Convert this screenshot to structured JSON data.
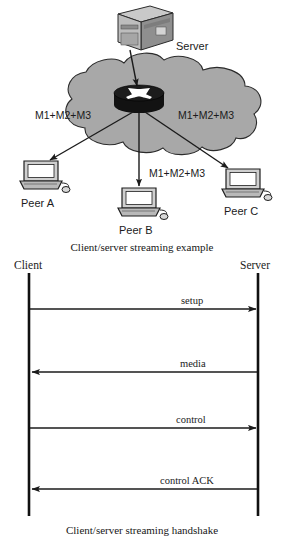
{
  "page": {
    "background_color": "#ffffff",
    "ink_color": "#1b1b1b",
    "cloud_fill": "#a8a8a8",
    "cloud_stroke": "#2b2b2b",
    "device_fill": "#bdbdbd",
    "router_fill": "#1c1c1c"
  },
  "topology": {
    "caption": "Client/server streaming example",
    "server": {
      "icon": "server-box-icon",
      "label": "Server"
    },
    "cloud": {
      "icon": "network-cloud-icon",
      "router_icon": "router-icon"
    },
    "flow_labels": [
      {
        "text": "M1+M2+M3",
        "target": "Peer A"
      },
      {
        "text": "M1+M2+M3",
        "target": "Peer C"
      },
      {
        "text": "M1+M2+M3",
        "target": "Peer B"
      }
    ],
    "peers": [
      {
        "label": "Peer A",
        "icon": "desktop-computer-icon"
      },
      {
        "label": "Peer B",
        "icon": "desktop-computer-icon"
      },
      {
        "label": "Peer C",
        "icon": "desktop-computer-icon"
      }
    ]
  },
  "handshake": {
    "caption": "Client/server streaming handshake",
    "lifelines": [
      {
        "label": "Client",
        "side": "left"
      },
      {
        "label": "Server",
        "side": "right"
      }
    ],
    "messages": [
      {
        "label": "setup",
        "direction": "client-to-server"
      },
      {
        "label": "media",
        "direction": "server-to-client"
      },
      {
        "label": "control",
        "direction": "client-to-server"
      },
      {
        "label": "control ACK",
        "direction": "server-to-client"
      }
    ]
  }
}
